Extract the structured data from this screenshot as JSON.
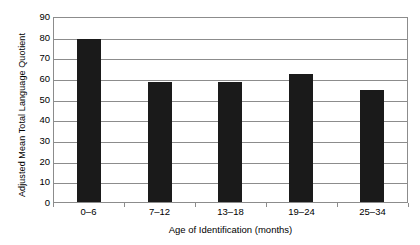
{
  "chart_data": {
    "type": "bar",
    "title": "",
    "xlabel": "Age of Identification (months)",
    "ylabel": "Adjusted Mean Total Language Quotient",
    "categories": [
      "0–6",
      "7–12",
      "13–18",
      "19–24",
      "25–34"
    ],
    "values": [
      79,
      58,
      58,
      62,
      54
    ],
    "ylim": [
      0,
      90
    ],
    "ytick_labels": [
      "90",
      "80",
      "70",
      "60",
      "50",
      "40",
      "30",
      "20",
      "10",
      "0"
    ],
    "ytick_values": [
      90,
      80,
      70,
      60,
      50,
      40,
      30,
      20,
      10,
      0
    ],
    "ytick_step": 10,
    "grid": true,
    "grid_axis": "y",
    "legend": false,
    "legend_position": "none",
    "bar_color": "#1a1a1a",
    "grid_color": "#8c8c8c",
    "background_color": "#ffffff"
  }
}
